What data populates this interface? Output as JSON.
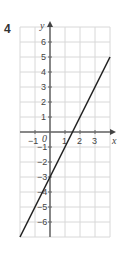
{
  "question_number": "4",
  "chart_data": {
    "type": "line",
    "title": "",
    "xlabel": "x",
    "ylabel": "y",
    "xlim": [
      -2,
      4
    ],
    "ylim": [
      -7,
      7
    ],
    "grid": true,
    "x_ticks": [
      -1,
      1,
      2,
      3
    ],
    "y_ticks": [
      -6,
      -5,
      -4,
      -3,
      -2,
      -1,
      1,
      2,
      3,
      4,
      5,
      6
    ],
    "origin_label": "0",
    "series": [
      {
        "name": "y = 2x - 3",
        "x": [
          -2,
          4
        ],
        "y": [
          -7,
          5
        ],
        "color": "#222222"
      }
    ]
  }
}
